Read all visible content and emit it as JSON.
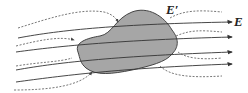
{
  "diagram": {
    "labels": {
      "applied_field": "E",
      "induced_field": "E′"
    },
    "colors": {
      "body_fill": "#a6a6a6",
      "body_stroke": "#444444",
      "field_line": "#333333",
      "induced_line": "#555555"
    }
  }
}
